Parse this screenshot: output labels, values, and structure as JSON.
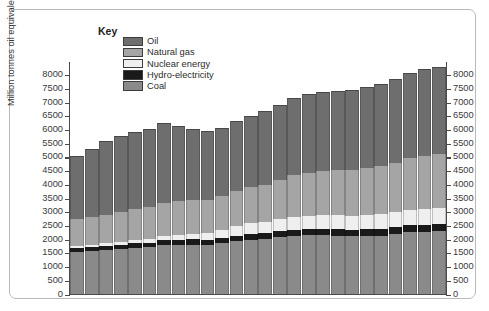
{
  "chart_data": {
    "type": "bar",
    "stacked": true,
    "title": "",
    "xlabel": "",
    "ylabel": "Million tonnes oil equivalent",
    "ylim": [
      0,
      8500
    ],
    "ytick_step": 500,
    "yticks": [
      0,
      500,
      1000,
      1500,
      2000,
      2500,
      3000,
      3500,
      4000,
      4500,
      5000,
      5500,
      6000,
      6500,
      7000,
      7500,
      8000
    ],
    "ytick_labels": [
      "0",
      "500",
      "1000",
      "1500",
      "2000",
      "2500",
      "3000",
      "3500",
      "4000",
      "4500",
      "5000",
      "5500",
      "6000",
      "6500",
      "7000",
      "7500",
      "8000"
    ],
    "dual_axis": true,
    "grid": false,
    "legend_title": "Key",
    "legend_position": "top-left-inside",
    "categories": [
      "73",
      "74",
      "75",
      "76",
      "77",
      "78",
      "79",
      "80",
      "81",
      "82",
      "83",
      "84",
      "85",
      "86",
      "87",
      "88",
      "89",
      "90",
      "91",
      "92",
      "93",
      "94",
      "95",
      "96",
      "97",
      "98"
    ],
    "series": [
      {
        "name": "Coal",
        "color": "#8a8a8a",
        "values": [
          1550,
          1580,
          1600,
          1640,
          1680,
          1700,
          1780,
          1800,
          1800,
          1790,
          1850,
          1920,
          1980,
          2000,
          2070,
          2120,
          2150,
          2150,
          2120,
          2100,
          2110,
          2130,
          2180,
          2250,
          2280,
          2300
        ]
      },
      {
        "name": "Hydro-electricity",
        "color": "#1a1a1a",
        "values": [
          140,
          145,
          155,
          160,
          165,
          175,
          180,
          185,
          190,
          195,
          205,
          210,
          215,
          220,
          225,
          230,
          230,
          235,
          240,
          240,
          245,
          250,
          250,
          255,
          255,
          255
        ]
      },
      {
        "name": "Nuclear energy",
        "color": "#efefef",
        "values": [
          60,
          75,
          95,
          110,
          125,
          145,
          155,
          180,
          215,
          245,
          290,
          335,
          390,
          405,
          435,
          465,
          475,
          485,
          510,
          515,
          525,
          535,
          555,
          570,
          585,
          590
        ]
      },
      {
        "name": "Natural gas",
        "color": "#a5a5a5",
        "values": [
          1000,
          1020,
          1030,
          1090,
          1130,
          1160,
          1220,
          1230,
          1220,
          1210,
          1220,
          1290,
          1330,
          1360,
          1440,
          1510,
          1560,
          1610,
          1650,
          1660,
          1720,
          1740,
          1810,
          1900,
          1930,
          1960
        ]
      },
      {
        "name": "Oil",
        "color": "#6e6e6e",
        "values": [
          2300,
          2460,
          2700,
          2760,
          2800,
          2840,
          2900,
          2720,
          2600,
          2520,
          2510,
          2560,
          2570,
          2690,
          2730,
          2830,
          2880,
          2900,
          2900,
          2930,
          2950,
          3000,
          3040,
          3090,
          3150,
          3180
        ]
      }
    ],
    "totals": [
      5050,
      5280,
      5580,
      5760,
      5900,
      6020,
      6235,
      6115,
      6025,
      5960,
      6075,
      6315,
      6445,
      6675,
      6900,
      7155,
      7295,
      7380,
      7420,
      7445,
      7550,
      7655,
      7835,
      8065,
      8200,
      8285
    ]
  },
  "legend": {
    "title": "Key",
    "items": [
      {
        "label": "Oil",
        "color": "#6e6e6e"
      },
      {
        "label": "Natural gas",
        "color": "#a5a5a5"
      },
      {
        "label": "Nuclear energy",
        "color": "#efefef"
      },
      {
        "label": "Hydro-electricity",
        "color": "#1a1a1a"
      },
      {
        "label": "Coal",
        "color": "#8a8a8a"
      }
    ]
  },
  "axes": {
    "y_title": "Million tonnes oil equivalent"
  }
}
